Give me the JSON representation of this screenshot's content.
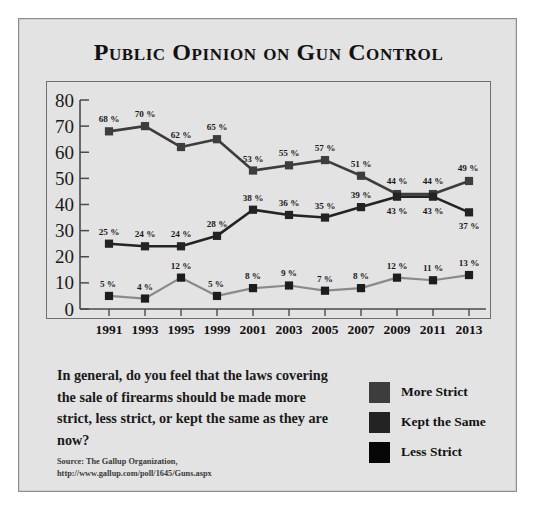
{
  "poster": {
    "title": "Public Opinion on Gun Control",
    "question": "In general, do you feel that the laws covering the sale of firearms should be made more strict, less strict, or kept the same as they are now?",
    "source_line1": "Source: The Gallup Organization,",
    "source_line2": "http://www.gallup.com/poll/1645/Guns.aspx"
  },
  "legend": {
    "position": "bottom-right",
    "items": [
      {
        "label": "More Strict",
        "color": "#3d3d3d"
      },
      {
        "label": "Kept the Same",
        "color": "#232323"
      },
      {
        "label": "Less Strict",
        "color": "#070707"
      }
    ]
  },
  "chart_data": {
    "type": "line",
    "title": "Public Opinion on Gun Control",
    "xlabel": "",
    "ylabel": "",
    "ylim": [
      0,
      80
    ],
    "yticks": [
      0,
      10,
      20,
      30,
      40,
      50,
      60,
      70,
      80
    ],
    "grid": false,
    "value_suffix": "%",
    "categories": [
      "1991",
      "1993",
      "1995",
      "1999",
      "2001",
      "2003",
      "2005",
      "2007",
      "2009",
      "2011",
      "2013"
    ],
    "series": [
      {
        "name": "More Strict",
        "color": "#3d3d3d",
        "marker": "square",
        "values": [
          68,
          70,
          62,
          65,
          53,
          55,
          57,
          51,
          44,
          44,
          49
        ],
        "labels": [
          "68 %",
          "70 %",
          "62 %",
          "65 %",
          "53 %",
          "55 %",
          "57 %",
          "51 %",
          "44 %",
          "44 %",
          "49 %"
        ]
      },
      {
        "name": "Kept the Same",
        "color": "#232323",
        "marker": "square",
        "values": [
          25,
          24,
          24,
          28,
          38,
          36,
          35,
          39,
          43,
          43,
          37
        ],
        "labels": [
          "25 %",
          "24 %",
          "24 %",
          "28 %",
          "38 %",
          "36 %",
          "35 %",
          "39 %",
          "43 %",
          "43 %",
          "37 %"
        ]
      },
      {
        "name": "Less Strict",
        "color": "#8a8a8a",
        "marker": "square",
        "values": [
          5,
          4,
          12,
          5,
          8,
          9,
          7,
          8,
          12,
          11,
          13
        ],
        "labels": [
          "5 %",
          "4 %",
          "12 %",
          "5 %",
          "8 %",
          "9 %",
          "7 %",
          "8 %",
          "12 %",
          "11 %",
          "13 %"
        ]
      }
    ]
  }
}
